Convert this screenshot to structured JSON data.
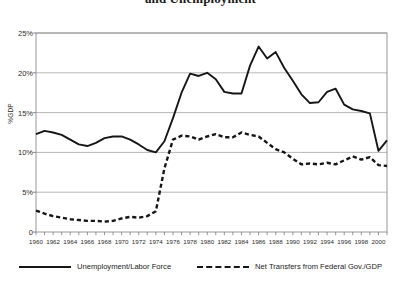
{
  "chart_data": {
    "type": "line",
    "title": "and Unemployment",
    "xlabel": "",
    "ylabel": "%GDP",
    "xlim": [
      1960,
      2001
    ],
    "ylim": [
      0,
      25
    ],
    "grid": true,
    "legend_position": "bottom",
    "y_ticks": [
      "0",
      "5%",
      "10%",
      "15%",
      "20%",
      "25%"
    ],
    "y_tick_values": [
      0,
      5,
      10,
      15,
      20,
      25
    ],
    "x_ticks": [
      "1960",
      "1962",
      "1964",
      "1966",
      "1968",
      "1970",
      "1972",
      "1974",
      "1976",
      "1978",
      "1980",
      "1982",
      "1984",
      "1986",
      "1988",
      "1990",
      "1992",
      "1994",
      "1996",
      "1998",
      "2000"
    ],
    "x_tick_values": [
      1960,
      1962,
      1964,
      1966,
      1968,
      1970,
      1972,
      1974,
      1976,
      1978,
      1980,
      1982,
      1984,
      1986,
      1988,
      1990,
      1992,
      1994,
      1996,
      1998,
      2000
    ],
    "x": [
      1960,
      1961,
      1962,
      1963,
      1964,
      1965,
      1966,
      1967,
      1968,
      1969,
      1970,
      1971,
      1972,
      1973,
      1974,
      1975,
      1976,
      1977,
      1978,
      1979,
      1980,
      1981,
      1982,
      1983,
      1984,
      1985,
      1986,
      1987,
      1988,
      1989,
      1990,
      1991,
      1992,
      1993,
      1994,
      1995,
      1996,
      1997,
      1998,
      1999,
      2000,
      2001
    ],
    "series": [
      {
        "name": "Unemployment/Labor Force",
        "style": "solid",
        "color": "#161616",
        "values": [
          12.3,
          12.7,
          12.5,
          12.2,
          11.6,
          11.0,
          10.8,
          11.2,
          11.8,
          12.0,
          12.0,
          11.6,
          11.0,
          10.3,
          10.0,
          11.4,
          14.3,
          17.5,
          19.9,
          19.6,
          20.0,
          19.2,
          17.6,
          17.4,
          17.4,
          20.9,
          23.3,
          21.8,
          22.6,
          20.6,
          19.0,
          17.3,
          16.2,
          16.3,
          17.6,
          18.0,
          16.0,
          15.4,
          15.2,
          14.9,
          10.2,
          11.5
        ]
      },
      {
        "name": "Net Transfers from Federal Gov./GDP",
        "style": "dashed",
        "color": "#161616",
        "values": [
          2.7,
          2.3,
          2.0,
          1.8,
          1.6,
          1.5,
          1.4,
          1.4,
          1.3,
          1.4,
          1.7,
          1.9,
          1.8,
          2.0,
          2.6,
          8.0,
          11.6,
          12.1,
          12.0,
          11.6,
          12.0,
          12.3,
          11.9,
          11.9,
          12.5,
          12.2,
          12.0,
          11.2,
          10.4,
          10.0,
          9.2,
          8.5,
          8.6,
          8.5,
          8.7,
          8.5,
          9.0,
          9.5,
          9.1,
          9.4,
          8.4,
          8.3
        ]
      }
    ]
  },
  "legend": [
    {
      "label": "Unemployment/Labor Force",
      "style": "solid"
    },
    {
      "label": "Net Transfers from Federal Gov./GDP",
      "style": "dashed"
    }
  ]
}
